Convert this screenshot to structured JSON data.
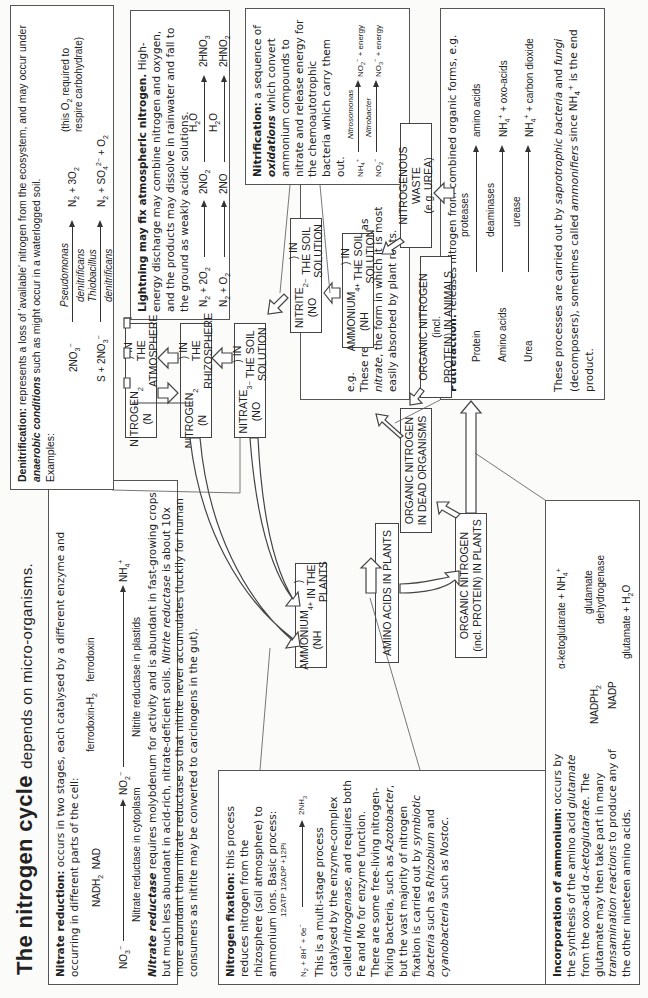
{
  "title": {
    "main": "The nitrogen cycle",
    "sub": "depends on micro-organisms."
  },
  "nitrate_reduction": {
    "heading": "Nitrate reduction:",
    "intro": "occurs in two stages, each catalysed by a different enzyme and occurring in different parts of the cell:",
    "eq": {
      "no3": "NO3−",
      "nadh2": "NADH2",
      "nad": "NAD",
      "no2": "NO2−",
      "fdh2": "ferrodoxin-H2",
      "fd": "ferrodoxin",
      "nh4": "NH4+",
      "enzyme1": "Nitrate reductase in cytoplasm",
      "enzyme2": "Nitrite reductase in plastids"
    },
    "para_term": "Nitrate reductase",
    "para": "requires molybdenum for activity and is abundant in fast-growing crops but much less abundant in acid-rich, nitrate-deficient soils.",
    "para_term2": "Nitrite reductase",
    "para2": "is about 10x more abundant than nitrate reductase so that nitrite never accumulates (luckily for human consumers as nitrite may be converted to carcinogens in the gut)."
  },
  "denitrification": {
    "heading": "Denitrification:",
    "intro_a": "represents a loss of 'available' nitrogen from the ecosystem, and may occur under",
    "intro_term": "anaerobic conditions",
    "intro_b": "such as might occur in a waterlogged soil.",
    "examples_label": "Examples:",
    "eq1": {
      "left": "2NO3−",
      "above": "Pseudomonas",
      "below": "denitrificans",
      "right": "N2 + 3O2",
      "note": "(this O2 required to respire carbohydrate)"
    },
    "eq2": {
      "left": "S + 2NO3−",
      "above": "Thiobacillus",
      "below": "denitrificans",
      "right": "N2 + SO4 2− + O2"
    }
  },
  "lightning": {
    "heading": "Lightning may fix atmospheric nitrogen.",
    "text": "High-energy discharge may combine nitrogen and oxygen, and the products may dissolve in rainwater and fall to the ground as weakly acidic solutions.",
    "eq1": {
      "left": "N2 + 2O2",
      "mid": "2NO2",
      "over": "H2O",
      "right": "2HNO3"
    },
    "eq2": {
      "left": "N2 + O2",
      "mid": "2NO",
      "over": "H2O",
      "right": "2HNO2"
    }
  },
  "nitrification": {
    "heading": "Nitrification:",
    "text_a": "a sequence of",
    "term": "oxidations",
    "text_b": "which convert ammonium compounds to nitrate and release energy for the chemoautotrophic bacteria which carry them out.",
    "eq1": {
      "left": "NH4+",
      "over": "Nitrosomonas",
      "right": "NO2− + energy"
    },
    "eq2": {
      "left": "NO2−",
      "over": "Nitrobacter",
      "right": "NO3− + energy"
    },
    "eg": "e.g.",
    "note_a": "These reactions offer nitrogen as",
    "note_term": "nitrate",
    "note_b": ", the form in which it is most easily absorbed by plant roots."
  },
  "putrefaction": {
    "heading": "Putrefaction:",
    "intro": "releases nitrogen from combined organic forms, e.g.",
    "rows": [
      {
        "left": "Protein",
        "enzyme": "proteases",
        "right": "amino acids"
      },
      {
        "left": "Amino acids",
        "enzyme": "deaminases",
        "right": "NH4+ + oxo-acids"
      },
      {
        "left": "Urea",
        "enzyme": "urease",
        "right": "NH4+ + carbon dioxide"
      }
    ],
    "footer_a": "These processes are carried out by",
    "footer_t1": "saprotrophic bacteria",
    "footer_b": "and",
    "footer_t2": "fungi",
    "footer_c": "(decomposers), sometimes called",
    "footer_t3": "ammonifiers",
    "footer_d": "since NH4+ is the end product."
  },
  "nitrogen_fixation": {
    "heading": "Nitrogen fixation:",
    "intro": "this process reduces nitrogen from the rhizosphere (soil atmosphere) to ammonium ions. Basic process:",
    "eq": {
      "left": "N2 + 8H+ + 6e−",
      "over": "12ATP  12ADP +12Pi",
      "right": "2NH3"
    },
    "para_a": "This is a multi-stage process catalysed by the enzyme-complex called",
    "term1": "nitrogenase",
    "para_b": ", and requires both Fe and Mo for enzyme function. There are some free-living nitrogen-fixing bacteria, such as",
    "term2": "Azotobacter",
    "para_c": ", but the vast majority of nitrogen fixation is carried out by",
    "term3": "symbiotic bacteria",
    "para_d": "such as",
    "term4": "Rhizobium",
    "para_e": "and",
    "term5": "cyanobacteria",
    "para_f": "such as",
    "term6": "Nostoc."
  },
  "incorporation": {
    "heading": "Incorporation of ammonium:",
    "text_a": "occurs by the synthesis of the amino acid",
    "term1": "glutamate",
    "text_b": "from the oxo-acid",
    "term2": "α-ketoglutarate.",
    "text_c": "The glutamate may then take part in many",
    "term3": "transamination reactions",
    "text_d": "to produce any of the other nineteen amino acids.",
    "eq": {
      "top": "α-ketoglutarate + NH4+",
      "nadph2": "NADPH2",
      "nadp": "NADP",
      "enzyme1": "glutamate",
      "enzyme2": "dehydrogenase",
      "bottom": "glutamate + H2O"
    }
  },
  "nodes": {
    "n2_atm": "NITROGEN (N2) IN THE ATMOSPHERE",
    "n2_rhizo": "NITROGEN (N2) IN THE RHIZOSPHERE",
    "no3_soil": "NITRATE (NO3−) IN THE SOIL SOLUTION",
    "no2_soil": "NITRITE (NO2−) IN THE SOIL SOLUTION",
    "nh4_soil": "AMMONIUM (NH4+) IN THE SOIL SOLUTION",
    "waste": "NITROGENOUS WASTE (e.g. UREA)",
    "org_animals": "ORGANIC NITROGEN (incl. PROTEIN) IN ANIMALS",
    "org_dead": "ORGANIC NITROGEN IN DEAD ORGANISMS",
    "org_plants": "ORGANIC NITROGEN (incl. PROTEIN) IN PLANTS",
    "nh4_plants": "AMMONIUM (NH4+) IN THE PLANTS",
    "amino_plants": "AMINO ACIDS IN PLANTS"
  }
}
